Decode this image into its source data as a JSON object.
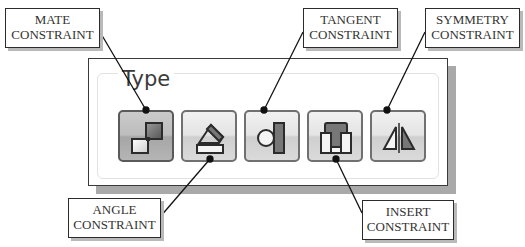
{
  "panel": {
    "group_label": "Type",
    "buttons": [
      {
        "id": "mate",
        "icon": "mate-constraint-icon",
        "active": true
      },
      {
        "id": "angle",
        "icon": "angle-constraint-icon",
        "active": false
      },
      {
        "id": "tangent",
        "icon": "tangent-constraint-icon",
        "active": false
      },
      {
        "id": "insert",
        "icon": "insert-constraint-icon",
        "active": false
      },
      {
        "id": "symmetry",
        "icon": "symmetry-constraint-icon",
        "active": false
      }
    ]
  },
  "callouts": {
    "mate": {
      "line1": "MATE",
      "line2": "CONSTRAINT"
    },
    "tangent": {
      "line1": "TANGENT",
      "line2": "CONSTRAINT"
    },
    "symmetry": {
      "line1": "SYMMETRY",
      "line2": "CONSTRAINT"
    },
    "angle": {
      "line1": "ANGLE",
      "line2": "CONSTRAINT"
    },
    "insert": {
      "line1": "INSERT",
      "line2": "CONSTRAINT"
    }
  },
  "colors": {
    "icon_dark": "#6e6e6e",
    "icon_light": "#f4f4f4",
    "outline": "#2b2b2b"
  }
}
